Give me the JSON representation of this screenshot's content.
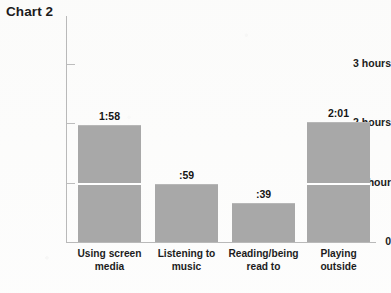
{
  "chart_data": {
    "type": "bar",
    "title": "Chart 2",
    "xlabel": "",
    "ylabel": "",
    "categories": [
      "Using screen media",
      "Listening to music",
      "Reading/being read to",
      "Playing outside"
    ],
    "values": [
      1.9667,
      0.9833,
      0.65,
      2.0167
    ],
    "value_labels": [
      "1:58",
      ":59",
      ":39",
      "2:01"
    ],
    "ylim": [
      0,
      3
    ],
    "ytick_values": [
      0,
      1,
      2,
      3
    ],
    "ytick_labels": [
      "0",
      "1 hour",
      "2 hours",
      "3 hours"
    ],
    "grid": false,
    "legend": null,
    "bar_color": "#a8a8a8",
    "axis_color": "#b9b9b9",
    "text_color": "#1c1c1c",
    "background": "#fdfdfd",
    "note": "White rule drawn across bars at the 1 hour level"
  }
}
